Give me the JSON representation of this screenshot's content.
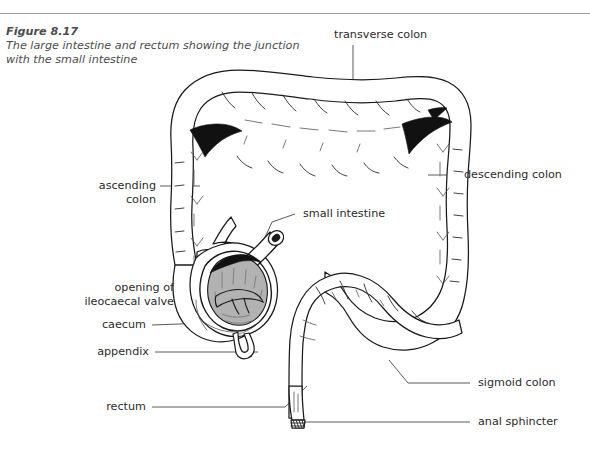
{
  "figure": {
    "number": "Figure 8.17",
    "description": "The large intestine and rectum showing the junction\nwith the small intestine"
  },
  "labels": {
    "transverse_colon": "transverse colon",
    "descending_colon": "descending colon",
    "ascending_colon": "ascending\ncolon",
    "small_intestine": "small intestine",
    "opening_of_ileocaecal_valve": "opening of\nileocaecal valve",
    "caecum": "caecum",
    "appendix": "appendix",
    "rectum": "rectum",
    "sigmoid_colon": "sigmoid colon",
    "anal_sphincter": "anal sphincter"
  },
  "colors": {
    "page_background": "#ffffff",
    "rule": "#9a9a9a",
    "caption_text": "#4c4c4c",
    "label_text": "#2b2b2b",
    "leader_line": "#5a5a5a",
    "organ_outline": "#1a1a1a",
    "organ_fill": "#ffffff",
    "cut_interior": "#b2b2b2",
    "shadow": "#111111"
  },
  "diagram": {
    "parts": [
      "ascending colon",
      "transverse colon",
      "descending colon",
      "sigmoid colon",
      "rectum",
      "anal sphincter",
      "caecum",
      "appendix",
      "small intestine",
      "ileocaecal valve"
    ]
  }
}
